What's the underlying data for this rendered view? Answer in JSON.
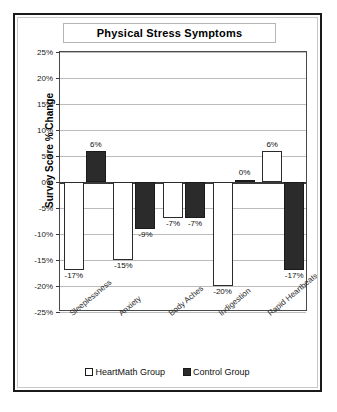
{
  "chart_data": {
    "type": "bar",
    "title": "Physical Stress Symptoms",
    "xlabel": "",
    "ylabel": "Survey Score % Change",
    "categories": [
      "Sleeplessness",
      "Anxiety",
      "Body Aches",
      "Indigestion",
      "Rapid Heartbeats"
    ],
    "series": [
      {
        "name": "HeartMath Group",
        "color": "#ffffff",
        "values": [
          -17,
          -15,
          -7,
          -20,
          6
        ],
        "labels": [
          "-17%",
          "-15%",
          "-7%",
          "-20%",
          "6%"
        ]
      },
      {
        "name": "Control Group",
        "color": "#2b2b2b",
        "values": [
          6,
          -9,
          -7,
          0,
          -17
        ],
        "labels": [
          "6%",
          "-9%",
          "-7%",
          "0%",
          "-17%"
        ]
      }
    ],
    "ylim": [
      -25,
      25
    ],
    "ytick_values": [
      25,
      20,
      15,
      10,
      5,
      0,
      -5,
      -10,
      -15,
      -20,
      -25
    ],
    "ytick_labels": [
      "25%",
      "20%",
      "15%",
      "10%",
      "5%",
      "0%",
      "-5%",
      "-10%",
      "-15%",
      "-20%",
      "-25%"
    ],
    "grid": true,
    "legend_position": "bottom"
  },
  "legend": {
    "items": [
      {
        "label": "HeartMath Group",
        "swatch": "light"
      },
      {
        "label": "Control Group",
        "swatch": "dark"
      }
    ]
  }
}
